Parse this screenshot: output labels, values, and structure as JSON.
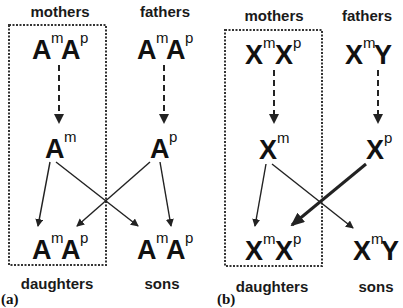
{
  "panels": [
    {
      "label": "(a)",
      "headers": {
        "mothers": "mothers",
        "fathers": "fathers"
      },
      "footers": {
        "daughters": "daughters",
        "sons": "sons"
      },
      "parents": {
        "mother": [
          {
            "base": "A",
            "sup": "m"
          },
          {
            "base": "A",
            "sup": "p"
          }
        ],
        "father": [
          {
            "base": "A",
            "sup": "m"
          },
          {
            "base": "A",
            "sup": "p"
          }
        ]
      },
      "gametes": {
        "mother": {
          "base": "A",
          "sup": "m"
        },
        "father": {
          "base": "A",
          "sup": "p"
        }
      },
      "offspring": {
        "daughter": [
          {
            "base": "A",
            "sup": "m"
          },
          {
            "base": "A",
            "sup": "p"
          }
        ],
        "son": [
          {
            "base": "A",
            "sup": "m"
          },
          {
            "base": "A",
            "sup": "p"
          }
        ]
      },
      "boxed_lineage": "mothers-daughters"
    },
    {
      "label": "(b)",
      "headers": {
        "mothers": "mothers",
        "fathers": "fathers"
      },
      "footers": {
        "daughters": "daughters",
        "sons": "sons"
      },
      "parents": {
        "mother": [
          {
            "base": "X",
            "sup": "m"
          },
          {
            "base": "X",
            "sup": "p"
          }
        ],
        "father": [
          {
            "base": "X",
            "sup": "m"
          },
          {
            "base": "Y",
            "sup": ""
          }
        ]
      },
      "gametes": {
        "mother": {
          "base": "X",
          "sup": "m"
        },
        "father": {
          "base": "X",
          "sup": "p"
        }
      },
      "offspring": {
        "daughter": [
          {
            "base": "X",
            "sup": "m"
          },
          {
            "base": "X",
            "sup": "p"
          }
        ],
        "son": [
          {
            "base": "X",
            "sup": "m"
          },
          {
            "base": "Y",
            "sup": ""
          }
        ]
      },
      "boxed_lineage": "mothers-daughters",
      "emphasized_arrow": "father-gamete-to-daughter"
    }
  ],
  "colors": {
    "ink": "#111111",
    "background": "#ffffff"
  }
}
